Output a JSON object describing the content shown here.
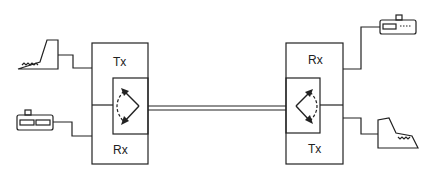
{
  "diagram": {
    "left_station": {
      "tx_label": "Tx",
      "rx_label": "Rx",
      "devices": [
        "keyboard-terminal",
        "printer"
      ]
    },
    "right_station": {
      "tx_label": "Tx",
      "rx_label": "Rx",
      "devices": [
        "printer",
        "keyboard-terminal"
      ]
    },
    "link": "duplex-line"
  }
}
